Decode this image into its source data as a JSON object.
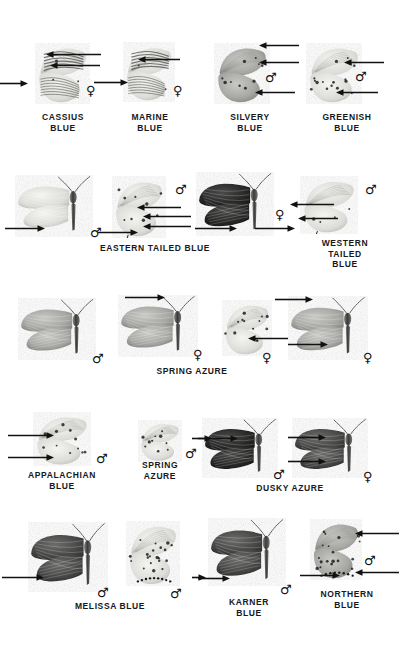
{
  "plate": {
    "title": "Blues (Lycaenidae) identification plate",
    "background_color": "#ffffff",
    "ink_color": "#16181c",
    "rows": 5
  },
  "symbols": {
    "male": "♂",
    "female": "♀"
  },
  "captions": [
    {
      "id": "cassius-blue",
      "text": "CASSIUS\nBLUE",
      "x": 63,
      "y": 112
    },
    {
      "id": "marine-blue",
      "text": "MARINE\nBLUE",
      "x": 150,
      "y": 112
    },
    {
      "id": "silvery-blue",
      "text": "SILVERY\nBLUE",
      "x": 250,
      "y": 112
    },
    {
      "id": "greenish-blue",
      "text": "GREENISH\nBLUE",
      "x": 347,
      "y": 112
    },
    {
      "id": "eastern-tailed-blue",
      "text": "EASTERN TAILED BLUE",
      "x": 155,
      "y": 243
    },
    {
      "id": "western-tailed-blue",
      "text": "WESTERN\nTAILED BLUE",
      "x": 345,
      "y": 238
    },
    {
      "id": "spring-azure-1",
      "text": "SPRING AZURE",
      "x": 192,
      "y": 366
    },
    {
      "id": "appalachian-blue",
      "text": "APPALACHIAN\nBLUE",
      "x": 62,
      "y": 470
    },
    {
      "id": "spring-azure-2",
      "text": "SPRING\nAZURE",
      "x": 160,
      "y": 460
    },
    {
      "id": "dusky-azure",
      "text": "DUSKY AZURE",
      "x": 290,
      "y": 483
    },
    {
      "id": "melissa-blue",
      "text": "MELISSA BLUE",
      "x": 110,
      "y": 601
    },
    {
      "id": "karner-blue",
      "text": "KARNER\nBLUE",
      "x": 249,
      "y": 597
    },
    {
      "id": "northern-blue",
      "text": "NORTHERN\nBLUE",
      "x": 347,
      "y": 589
    }
  ],
  "sex_marks": [
    {
      "id": "cassius-female",
      "symbol": "♀",
      "x": 86,
      "y": 84
    },
    {
      "id": "marine-female",
      "symbol": "♀",
      "x": 173,
      "y": 84
    },
    {
      "id": "silvery-male",
      "symbol": "♂",
      "x": 265,
      "y": 71
    },
    {
      "id": "greenish-male",
      "symbol": "♂",
      "x": 355,
      "y": 70
    },
    {
      "id": "eastern-tailed-male-a",
      "symbol": "♂",
      "x": 90,
      "y": 226
    },
    {
      "id": "eastern-tailed-male-b",
      "symbol": "♂",
      "x": 175,
      "y": 183
    },
    {
      "id": "eastern-tailed-female",
      "symbol": "♀",
      "x": 275,
      "y": 208
    },
    {
      "id": "western-tailed-male",
      "symbol": "♂",
      "x": 365,
      "y": 183
    },
    {
      "id": "spring-azure-male-1",
      "symbol": "♂",
      "x": 92,
      "y": 352
    },
    {
      "id": "spring-azure-female-1",
      "symbol": "♀",
      "x": 193,
      "y": 348
    },
    {
      "id": "spring-azure-female-2",
      "symbol": "♀",
      "x": 262,
      "y": 351
    },
    {
      "id": "spring-azure-female-3",
      "symbol": "♀",
      "x": 363,
      "y": 351
    },
    {
      "id": "appalachian-male",
      "symbol": "♂",
      "x": 96,
      "y": 452
    },
    {
      "id": "spring-azure-male-2",
      "symbol": "♂",
      "x": 185,
      "y": 447
    },
    {
      "id": "dusky-azure-male",
      "symbol": "♂",
      "x": 273,
      "y": 468
    },
    {
      "id": "dusky-azure-female",
      "symbol": "♀",
      "x": 363,
      "y": 470
    },
    {
      "id": "melissa-male",
      "symbol": "♂",
      "x": 97,
      "y": 586
    },
    {
      "id": "melissa-ventral-male",
      "symbol": "♂",
      "x": 170,
      "y": 587
    },
    {
      "id": "karner-male",
      "symbol": "♂",
      "x": 280,
      "y": 583
    },
    {
      "id": "northern-male",
      "symbol": "♂",
      "x": 364,
      "y": 554
    }
  ],
  "arrows": [
    {
      "id": "arrow-cassius-forewing-bands",
      "x": 46,
      "y": 54,
      "len": 55,
      "dir": "left"
    },
    {
      "id": "arrow-cassius-forewing-spot",
      "x": 50,
      "y": 65,
      "len": 50,
      "dir": "left"
    },
    {
      "id": "arrow-cassius-hindwing-eyespot",
      "x": 0,
      "y": 83,
      "len": 28,
      "dir": "right"
    },
    {
      "id": "arrow-marine-bands",
      "x": 138,
      "y": 59,
      "len": 42,
      "dir": "left"
    },
    {
      "id": "arrow-marine-hindwing",
      "x": 94,
      "y": 82,
      "len": 34,
      "dir": "right"
    },
    {
      "id": "arrow-silvery-margin",
      "x": 259,
      "y": 45,
      "len": 40,
      "dir": "left"
    },
    {
      "id": "arrow-silvery-spotrow",
      "x": 259,
      "y": 62,
      "len": 40,
      "dir": "left"
    },
    {
      "id": "arrow-silvery-hindspots",
      "x": 255,
      "y": 92,
      "len": 40,
      "dir": "left"
    },
    {
      "id": "arrow-greenish-forespots",
      "x": 344,
      "y": 62,
      "len": 40,
      "dir": "left"
    },
    {
      "id": "arrow-greenish-hindspots",
      "x": 336,
      "y": 92,
      "len": 42,
      "dir": "left"
    },
    {
      "id": "arrow-eastern-tail-left",
      "x": 5,
      "y": 228,
      "len": 40,
      "dir": "right"
    },
    {
      "id": "arrow-eastern-orange-spot",
      "x": 137,
      "y": 207,
      "len": 44,
      "dir": "left"
    },
    {
      "id": "arrow-eastern-hind-spot",
      "x": 143,
      "y": 216,
      "len": 48,
      "dir": "left"
    },
    {
      "id": "arrow-eastern-tail",
      "x": 143,
      "y": 226,
      "len": 48,
      "dir": "left"
    },
    {
      "id": "arrow-eastern-tail-base",
      "x": 98,
      "y": 232,
      "len": 40,
      "dir": "right"
    },
    {
      "id": "arrow-eastern-female-tail",
      "x": 195,
      "y": 228,
      "len": 42,
      "dir": "right"
    },
    {
      "id": "arrow-western-forespot",
      "x": 290,
      "y": 204,
      "len": 44,
      "dir": "left"
    },
    {
      "id": "arrow-western-hindspot",
      "x": 298,
      "y": 218,
      "len": 40,
      "dir": "left"
    },
    {
      "id": "arrow-western-margin",
      "x": 255,
      "y": 228,
      "len": 40,
      "dir": "right"
    },
    {
      "id": "arrow-spring-azure-dark-edge",
      "x": 125,
      "y": 297,
      "len": 40,
      "dir": "right"
    },
    {
      "id": "arrow-spring-azure-hind-mark",
      "x": 248,
      "y": 338,
      "len": 40,
      "dir": "left"
    },
    {
      "id": "arrow-spring-azure-dark-fw",
      "x": 275,
      "y": 299,
      "len": 38,
      "dir": "right"
    },
    {
      "id": "arrow-spring-azure-hind-edge",
      "x": 288,
      "y": 344,
      "len": 40,
      "dir": "right"
    },
    {
      "id": "arrow-appalachian-upper",
      "x": 8,
      "y": 435,
      "len": 46,
      "dir": "right"
    },
    {
      "id": "arrow-appalachian-lower",
      "x": 8,
      "y": 457,
      "len": 46,
      "dir": "right"
    },
    {
      "id": "arrow-spring-azure2-edge",
      "x": 192,
      "y": 438,
      "len": 20,
      "dir": "right"
    },
    {
      "id": "arrow-dusky-forewing",
      "x": 198,
      "y": 438,
      "len": 40,
      "dir": "right"
    },
    {
      "id": "arrow-dusky-female-fw",
      "x": 288,
      "y": 437,
      "len": 38,
      "dir": "right"
    },
    {
      "id": "arrow-dusky-female-hw",
      "x": 288,
      "y": 461,
      "len": 38,
      "dir": "right"
    },
    {
      "id": "arrow-melissa-hindwing",
      "x": 2,
      "y": 577,
      "len": 42,
      "dir": "right"
    },
    {
      "id": "arrow-melissa-ventral",
      "x": 192,
      "y": 577,
      "len": 14,
      "dir": "right"
    },
    {
      "id": "arrow-karner-hindwing",
      "x": 198,
      "y": 578,
      "len": 32,
      "dir": "right"
    },
    {
      "id": "arrow-northern-fw-spots",
      "x": 355,
      "y": 533,
      "len": 44,
      "dir": "left"
    },
    {
      "id": "arrow-northern-hw-spots",
      "x": 355,
      "y": 572,
      "len": 44,
      "dir": "left"
    },
    {
      "id": "arrow-northern-hw-base",
      "x": 300,
      "y": 575,
      "len": 40,
      "dir": "right"
    }
  ],
  "specimens": [
    {
      "id": "cassius-blue-ventral",
      "common_name": "Cassius Blue",
      "sex": "female",
      "view": "ventral-closed",
      "x": 35,
      "y": 42,
      "w": 55,
      "h": 62
    },
    {
      "id": "marine-blue-ventral",
      "common_name": "Marine Blue",
      "sex": "female",
      "view": "ventral-closed",
      "x": 123,
      "y": 42,
      "w": 52,
      "h": 60
    },
    {
      "id": "silvery-blue-ventral",
      "common_name": "Silvery Blue",
      "sex": "male",
      "view": "ventral-closed",
      "x": 214,
      "y": 42,
      "w": 56,
      "h": 62
    },
    {
      "id": "greenish-blue-ventral",
      "common_name": "Greenish Blue",
      "sex": "male",
      "view": "ventral-closed",
      "x": 306,
      "y": 42,
      "w": 56,
      "h": 62
    },
    {
      "id": "eastern-tailed-blue-dorsal",
      "common_name": "Eastern Tailed Blue",
      "sex": "male",
      "view": "dorsal-spread",
      "x": 15,
      "y": 175,
      "w": 78,
      "h": 62
    },
    {
      "id": "eastern-tailed-blue-ventral",
      "common_name": "Eastern Tailed Blue",
      "sex": "male",
      "view": "ventral-closed",
      "x": 112,
      "y": 176,
      "w": 54,
      "h": 62
    },
    {
      "id": "eastern-tailed-blue-female",
      "common_name": "Eastern Tailed Blue",
      "sex": "female",
      "view": "dorsal-spread",
      "x": 196,
      "y": 172,
      "w": 78,
      "h": 64
    },
    {
      "id": "western-tailed-blue-ventral",
      "common_name": "Western Tailed Blue",
      "sex": "male",
      "view": "ventral-closed",
      "x": 300,
      "y": 176,
      "w": 58,
      "h": 58
    },
    {
      "id": "spring-azure-male-dorsal",
      "common_name": "Spring Azure",
      "sex": "male",
      "view": "dorsal-spread",
      "x": 18,
      "y": 298,
      "w": 78,
      "h": 62
    },
    {
      "id": "spring-azure-female-dorsal",
      "common_name": "Spring Azure",
      "sex": "female",
      "view": "dorsal-spread",
      "x": 118,
      "y": 295,
      "w": 80,
      "h": 62
    },
    {
      "id": "spring-azure-female-ventral",
      "common_name": "Spring Azure",
      "sex": "female",
      "view": "ventral-closed",
      "x": 222,
      "y": 300,
      "w": 50,
      "h": 56
    },
    {
      "id": "spring-azure-female-dorsal2",
      "common_name": "Spring Azure",
      "sex": "female",
      "view": "dorsal-spread",
      "x": 288,
      "y": 296,
      "w": 80,
      "h": 64
    },
    {
      "id": "appalachian-blue-ventral",
      "common_name": "Appalachian Blue",
      "sex": "male",
      "view": "ventral-closed",
      "x": 33,
      "y": 412,
      "w": 58,
      "h": 54
    },
    {
      "id": "spring-azure-small-ventral",
      "common_name": "Spring Azure",
      "sex": "male",
      "view": "ventral-closed",
      "x": 138,
      "y": 420,
      "w": 44,
      "h": 42
    },
    {
      "id": "dusky-azure-male-dorsal",
      "common_name": "Dusky Azure",
      "sex": "male",
      "view": "dorsal-spread",
      "x": 202,
      "y": 418,
      "w": 76,
      "h": 60
    },
    {
      "id": "dusky-azure-female-dorsal",
      "common_name": "Dusky Azure",
      "sex": "female",
      "view": "dorsal-spread",
      "x": 292,
      "y": 418,
      "w": 76,
      "h": 60
    },
    {
      "id": "melissa-blue-dorsal",
      "common_name": "Melissa Blue",
      "sex": "male",
      "view": "dorsal-spread",
      "x": 28,
      "y": 522,
      "w": 80,
      "h": 70
    },
    {
      "id": "melissa-blue-ventral",
      "common_name": "Melissa Blue",
      "sex": "male",
      "view": "ventral-closed",
      "x": 126,
      "y": 520,
      "w": 54,
      "h": 66
    },
    {
      "id": "karner-blue-dorsal",
      "common_name": "Karner Blue",
      "sex": "male",
      "view": "dorsal-spread",
      "x": 208,
      "y": 518,
      "w": 78,
      "h": 68
    },
    {
      "id": "northern-blue-ventral",
      "common_name": "Northern Blue",
      "sex": "male",
      "view": "ventral-closed",
      "x": 310,
      "y": 518,
      "w": 52,
      "h": 62
    }
  ]
}
